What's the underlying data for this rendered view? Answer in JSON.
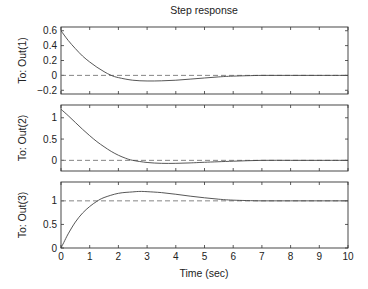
{
  "chart_data": {
    "type": "line",
    "title": "Step response",
    "xlabel": "Time (sec)",
    "xlim": [
      0,
      10
    ],
    "xticks": [
      0,
      1,
      2,
      3,
      4,
      5,
      6,
      7,
      8,
      9,
      10
    ],
    "grid": false,
    "legend": null,
    "subplots": [
      {
        "ylabel": "To: Out(1)",
        "ylim": [
          -0.25,
          0.65
        ],
        "yticks": [
          -0.2,
          0,
          0.2,
          0.4,
          0.6
        ],
        "ytick_labels": [
          "−0.2",
          "0",
          "0.2",
          "0.4",
          "0.6"
        ],
        "reference_value": 0,
        "series": [
          {
            "name": "step",
            "x": [
              0,
              0.25,
              0.5,
              0.75,
              1.0,
              1.25,
              1.5,
              1.75,
              2.0,
              2.5,
              3.0,
              3.5,
              4.0,
              4.5,
              5.0,
              5.5,
              6.0,
              7.0,
              8.0,
              9.0,
              10.0
            ],
            "y": [
              0.6,
              0.47,
              0.36,
              0.26,
              0.18,
              0.11,
              0.05,
              0.0,
              -0.03,
              -0.065,
              -0.075,
              -0.073,
              -0.065,
              -0.05,
              -0.035,
              -0.02,
              -0.01,
              0.0,
              0.0,
              0.0,
              0.0
            ]
          }
        ]
      },
      {
        "ylabel": "To: Out(2)",
        "ylim": [
          -0.25,
          1.3
        ],
        "yticks": [
          0,
          0.5,
          1
        ],
        "ytick_labels": [
          "0",
          "0.5",
          "1"
        ],
        "reference_value": 0,
        "series": [
          {
            "name": "step",
            "x": [
              0,
              0.25,
              0.5,
              0.75,
              1.0,
              1.25,
              1.5,
              1.75,
              2.0,
              2.25,
              2.5,
              3.0,
              3.5,
              4.0,
              4.5,
              5.0,
              6.0,
              7.0,
              8.0,
              9.0,
              10.0
            ],
            "y": [
              1.2,
              1.05,
              0.89,
              0.73,
              0.58,
              0.44,
              0.32,
              0.21,
              0.12,
              0.05,
              0.0,
              -0.05,
              -0.07,
              -0.07,
              -0.06,
              -0.045,
              -0.02,
              0.0,
              0.0,
              0.0,
              0.0
            ]
          }
        ]
      },
      {
        "ylabel": "To: Out(3)",
        "ylim": [
          0,
          1.4
        ],
        "yticks": [
          0,
          0.5,
          1
        ],
        "ytick_labels": [
          "0",
          "0.5",
          "1"
        ],
        "reference_value": 1,
        "series": [
          {
            "name": "step",
            "x": [
              0,
              0.1,
              0.25,
              0.5,
              0.75,
              1.0,
              1.25,
              1.5,
              2.0,
              2.5,
              2.75,
              3.0,
              3.5,
              4.0,
              4.5,
              5.0,
              5.5,
              6.0,
              7.0,
              8.0,
              9.0,
              10.0
            ],
            "y": [
              0,
              0.12,
              0.3,
              0.55,
              0.74,
              0.88,
              0.99,
              1.07,
              1.16,
              1.19,
              1.2,
              1.195,
              1.175,
              1.14,
              1.1,
              1.065,
              1.035,
              1.015,
              1.0,
              1.0,
              1.0,
              1.0
            ]
          }
        ]
      }
    ]
  },
  "layout": {
    "plot_left": 61,
    "plot_right": 348,
    "panels": [
      {
        "top": 27,
        "bottom": 94
      },
      {
        "top": 105,
        "bottom": 171
      },
      {
        "top": 182,
        "bottom": 248
      }
    ]
  }
}
